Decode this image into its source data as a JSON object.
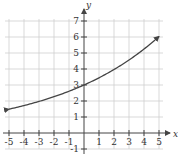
{
  "chart_data": {
    "type": "line",
    "title": "",
    "xlabel": "x",
    "ylabel": "y",
    "xlim": [
      -5,
      5
    ],
    "ylim": [
      -1,
      7
    ],
    "x_ticks": [
      -5,
      -4,
      -3,
      -2,
      -1,
      1,
      2,
      3,
      4,
      5
    ],
    "y_ticks": [
      -1,
      1,
      2,
      3,
      4,
      5,
      6,
      7
    ],
    "grid": true,
    "function": "y = 3(1.15)^x",
    "series": [
      {
        "name": "exponential growth curve",
        "x": [
          -5,
          -4,
          -3,
          -2,
          -1,
          0,
          1,
          2,
          3,
          4,
          5
        ],
        "values": [
          1.49,
          1.72,
          1.97,
          2.27,
          2.61,
          3.0,
          3.45,
          3.97,
          4.56,
          5.25,
          6.03
        ],
        "arrows_both_ends": true
      }
    ],
    "y_intercept": 3
  },
  "labels": {
    "x_axis": "x",
    "y_axis": "y"
  }
}
